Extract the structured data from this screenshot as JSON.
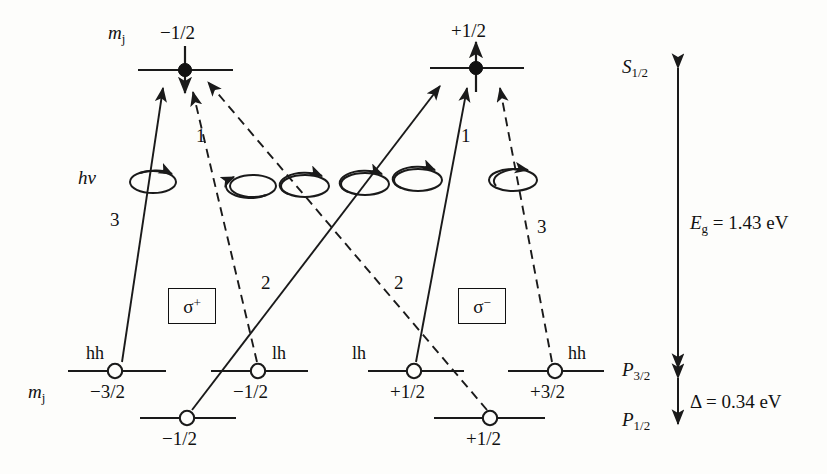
{
  "figure": {
    "axis_labels": {
      "mj_top": "m",
      "mj_top_sub": "j",
      "mj_bottom": "m",
      "mj_bottom_sub": "j"
    }
  },
  "conduction_levels": [
    {
      "id": "cb-left",
      "mj": "−1/2",
      "spin": "down",
      "x": 185,
      "y": 70
    },
    {
      "id": "cb-right",
      "mj": "+1/2",
      "spin": "up",
      "x": 476,
      "y": 68
    }
  ],
  "valence_levels": [
    {
      "id": "hh-m32",
      "band": "hh",
      "mj": "−3/2",
      "shell": "P3/2",
      "x": 115,
      "y": 371
    },
    {
      "id": "lh-m12",
      "band": "lh",
      "mj": "−1/2",
      "shell": "P3/2",
      "x": 258,
      "y": 371
    },
    {
      "id": "lh-p12",
      "band": "lh",
      "mj": "+1/2",
      "shell": "P3/2",
      "x": 414,
      "y": 371
    },
    {
      "id": "hh-p32",
      "band": "hh",
      "mj": "+3/2",
      "shell": "P3/2",
      "x": 555,
      "y": 371
    },
    {
      "id": "so-m12",
      "band": "",
      "mj": "−1/2",
      "shell": "P1/2",
      "x": 187,
      "y": 418
    },
    {
      "id": "so-p12",
      "band": "",
      "mj": "+1/2",
      "shell": "P1/2",
      "x": 490,
      "y": 418
    }
  ],
  "transitions": [
    {
      "id": "t-sp-3",
      "polarization": "sigma+",
      "strength": "3",
      "style": "solid",
      "from": "hh-m32",
      "to": "cb-left",
      "label_x": 110,
      "label_y": 218
    },
    {
      "id": "t-sp-1",
      "polarization": "sigma+",
      "strength": "1",
      "style": "dashed",
      "from": "lh-m12",
      "to": "cb-left",
      "label_x": 196,
      "label_y": 134
    },
    {
      "id": "t-sp-2",
      "polarization": "sigma+",
      "strength": "2",
      "style": "dashed",
      "from": "so-p12",
      "to": "cb-left",
      "label_x": 261,
      "label_y": 281
    },
    {
      "id": "t-sm-3",
      "polarization": "sigma-",
      "strength": "3",
      "style": "dashed",
      "from": "hh-p32",
      "to": "cb-right",
      "label_x": 537,
      "label_y": 225
    },
    {
      "id": "t-sm-1",
      "polarization": "sigma-",
      "strength": "1",
      "style": "solid",
      "from": "lh-p12",
      "to": "cb-right",
      "label_x": 461,
      "label_y": 134
    },
    {
      "id": "t-sm-2",
      "polarization": "sigma-",
      "strength": "2",
      "style": "solid",
      "from": "so-m12",
      "to": "cb-right",
      "label_x": 394,
      "label_y": 281
    }
  ],
  "polarization_boxes": [
    {
      "id": "sigma-plus",
      "symbol": "σ",
      "sign": "+",
      "x": 168,
      "y": 288,
      "w": 46,
      "h": 34
    },
    {
      "id": "sigma-minus",
      "symbol": "σ",
      "sign": "−",
      "x": 458,
      "y": 288,
      "w": 46,
      "h": 34
    }
  ],
  "photon_label": {
    "h": "h",
    "nu": "ν",
    "x": 78,
    "y": 178
  },
  "energy_axis": {
    "top_label": "S",
    "top_sub": "1/2",
    "mid_label": "P",
    "mid_sub": "3/2",
    "bot_label": "P",
    "bot_sub": "1/2",
    "gap_symbol": "E",
    "gap_sub": "g",
    "gap_value": "= 1.43 eV",
    "split_symbol": "Δ",
    "split_value": "= 0.34 eV",
    "x": 678
  },
  "colors": {
    "line": "#1a1a1a",
    "background": "#fdfdfb",
    "fill_electron": "#111111",
    "fill_hole": "#ffffff"
  }
}
